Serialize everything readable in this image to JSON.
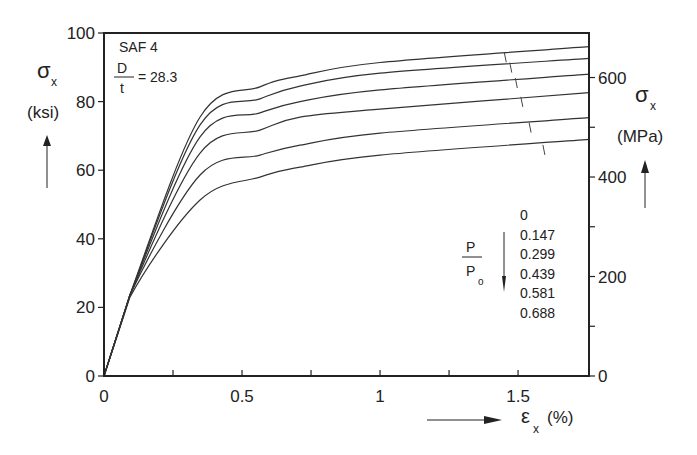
{
  "chart_data": {
    "type": "line",
    "title": "",
    "annotation": {
      "material": "SAF 4",
      "ratio_numerator": "D",
      "ratio_denominator": "t",
      "ratio_value": "= 28.3"
    },
    "xlabel": {
      "symbol": "ε",
      "subscript": "x",
      "unit": "(%)"
    },
    "ylabel_left": {
      "symbol": "σ",
      "subscript": "x",
      "unit": "(ksi)"
    },
    "ylabel_right": {
      "symbol": "σ",
      "subscript": "x",
      "unit": "(MPa)"
    },
    "xlim": [
      0,
      1.757
    ],
    "ylim": [
      0,
      100
    ],
    "ylim_right_mpa": [
      0,
      689.5
    ],
    "x_ticks": [
      0,
      0.5,
      1,
      1.5
    ],
    "x_tick_labels": [
      "0",
      "0.5",
      "1",
      "1.5"
    ],
    "x_minor_ticks": [
      0.25,
      0.75,
      1.25
    ],
    "y_ticks": [
      0,
      20,
      40,
      60,
      80,
      100
    ],
    "y_tick_labels": [
      "0",
      "20",
      "40",
      "60",
      "80",
      "100"
    ],
    "y_right_ticks_mpa": [
      0,
      200,
      400,
      600
    ],
    "y_right_tick_labels": [
      "0",
      "200",
      "400",
      "600"
    ],
    "y_right_minor_ticks_mpa": [
      100,
      300,
      500
    ],
    "grid": false,
    "legend": {
      "title_numerator": "P",
      "title_denominator": "P",
      "title_denominator_sub": "o",
      "entries": [
        "0",
        "0.147",
        "0.299",
        "0.439",
        "0.581",
        "0.688"
      ],
      "position": "lower-right inside"
    },
    "x": [
      0,
      0.094,
      0.348,
      0.565,
      0.71,
      1.0,
      1.757
    ],
    "series": [
      {
        "name": "P/Po = 0",
        "values": [
          0,
          23.6,
          75.5,
          84.3,
          87.5,
          91.4,
          96.0
        ],
        "marker_at": [
          1.45,
          93.5
        ]
      },
      {
        "name": "P/Po = 0.147",
        "values": [
          0,
          23.6,
          73.2,
          80.8,
          84.5,
          88.3,
          92.6
        ],
        "marker_at": [
          1.47,
          90.5
        ]
      },
      {
        "name": "P/Po = 0.299",
        "values": [
          0,
          23.6,
          69.7,
          76.7,
          80.0,
          83.4,
          88.0
        ],
        "marker_at": [
          1.49,
          86.0
        ]
      },
      {
        "name": "P/Po = 0.439",
        "values": [
          0,
          23.6,
          65.0,
          71.7,
          75.5,
          77.8,
          82.6
        ],
        "marker_at": [
          1.51,
          80.5
        ]
      },
      {
        "name": "P/Po = 0.581",
        "values": [
          0,
          23.6,
          58.6,
          64.4,
          67.3,
          70.8,
          75.3
        ],
        "marker_at": [
          1.54,
          73.0
        ]
      },
      {
        "name": "P/Po = 0.688",
        "values": [
          0,
          23.0,
          51.3,
          58.0,
          60.9,
          64.4,
          69.0
        ],
        "marker_at": [
          1.59,
          66.5
        ]
      }
    ],
    "line_color": "#333333"
  }
}
